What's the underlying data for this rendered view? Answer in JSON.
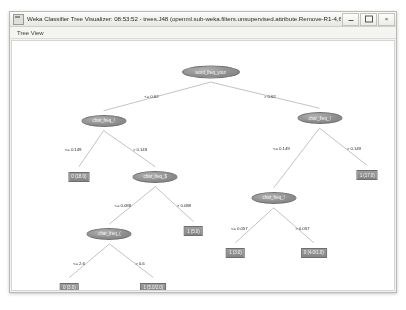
{
  "window": {
    "title": "Weka Classifier Tree Visualizer: 08:53:52 - trees.J48 (openml.sub-weka.filters.unsupervised.attribute.Remove-R1-4,6-20,22...",
    "icon": "app-window-icon",
    "controls": {
      "minimize_label": "–",
      "maximize_label": "☐",
      "close_label": "×"
    }
  },
  "menu": {
    "items": [
      {
        "label": "Tree View"
      }
    ]
  },
  "tree": {
    "nodes": [
      {
        "id": "n0",
        "label": "word_freq_your",
        "x": 52.0,
        "y": 12.5,
        "w": 58,
        "h": 13
      },
      {
        "id": "n1",
        "label": "char_freq_!",
        "x": 24.0,
        "y": 32.0,
        "w": 45,
        "h": 12
      },
      {
        "id": "n2",
        "label": "char_freq_!",
        "x": 80.5,
        "y": 31.0,
        "w": 45,
        "h": 12
      },
      {
        "id": "n3",
        "label": "char_freq_$",
        "x": 37.5,
        "y": 54.5,
        "w": 45,
        "h": 12
      },
      {
        "id": "n4",
        "label": "char_freq_!",
        "x": 68.5,
        "y": 63.0,
        "w": 45,
        "h": 12
      },
      {
        "id": "n5",
        "label": "char_freq_(",
        "x": 25.5,
        "y": 77.5,
        "w": 45,
        "h": 12
      }
    ],
    "leaves": [
      {
        "id": "l0",
        "label": "0 (18.0)",
        "x": 17.5,
        "y": 54.5
      },
      {
        "id": "l1",
        "label": "1 (5.0)",
        "x": 47.5,
        "y": 76.5
      },
      {
        "id": "l2",
        "label": "1 (17.0)",
        "x": 93.0,
        "y": 54.0
      },
      {
        "id": "l3",
        "label": "1 (3.0)",
        "x": 58.5,
        "y": 85.0
      },
      {
        "id": "l4",
        "label": "0 (4.0/1.0)",
        "x": 79.0,
        "y": 85.0
      },
      {
        "id": "l5",
        "label": "0 (3.0)",
        "x": 15.0,
        "y": 99.0
      },
      {
        "id": "l6",
        "label": "1 (5.0/2.0)",
        "x": 37.0,
        "y": 99.0
      }
    ],
    "edges": [
      {
        "from": "n0",
        "to": "n1",
        "label": "<= 0.62",
        "lx": 36.5,
        "ly": 22.0
      },
      {
        "from": "n0",
        "to": "n2",
        "label": "> 0.62",
        "lx": 67.5,
        "ly": 22.0
      },
      {
        "from": "n1",
        "to": "l0",
        "label": "<= 0.149",
        "lx": 16.0,
        "ly": 43.5
      },
      {
        "from": "n1",
        "to": "n3",
        "label": "> 0.149",
        "lx": 33.5,
        "ly": 43.5
      },
      {
        "from": "n2",
        "to": "n4",
        "label": "<= 0.149",
        "lx": 70.5,
        "ly": 43.0
      },
      {
        "from": "n2",
        "to": "l2",
        "label": "> 0.149",
        "lx": 89.5,
        "ly": 43.0
      },
      {
        "from": "n3",
        "to": "n5",
        "label": "<= 0.088",
        "lx": 29.0,
        "ly": 66.0
      },
      {
        "from": "n3",
        "to": "l1",
        "label": "> 0.088",
        "lx": 45.0,
        "ly": 66.0
      },
      {
        "from": "n4",
        "to": "l3",
        "label": "<= 0.057",
        "lx": 59.5,
        "ly": 75.0
      },
      {
        "from": "n4",
        "to": "l4",
        "label": "> 0.057",
        "lx": 76.0,
        "ly": 75.0
      },
      {
        "from": "n5",
        "to": "l5",
        "label": "<= 2.6",
        "lx": 17.5,
        "ly": 89.0
      },
      {
        "from": "n5",
        "to": "l6",
        "label": "> 0.6",
        "lx": 33.5,
        "ly": 89.0
      }
    ]
  },
  "colors": {
    "node_fill": "#8f8f8f",
    "leaf_fill": "#8d8d8d",
    "edge_stroke": "#9a9a9a",
    "canvas_bg": "#ffffff",
    "window_chrome": "#f2f2f0"
  }
}
